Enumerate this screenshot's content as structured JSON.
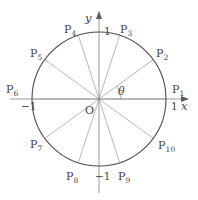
{
  "figure": {
    "background": "#ffffff",
    "stroke_circle": "#4d4d4d",
    "stroke_axis": "#8c8c8c",
    "stroke_chord": "#999999",
    "text_color": "#444444"
  },
  "geometry": {
    "center_x": 99,
    "center_y": 99,
    "radius": 67,
    "point_count": 10,
    "start_angle_deg": 0,
    "step_deg": 36
  },
  "axes": {
    "x_label": "x",
    "y_label": "y",
    "x_ticks": [
      {
        "value": "1",
        "at_deg": 0
      },
      {
        "value": "−1",
        "at_deg": 180
      }
    ],
    "y_ticks": [
      {
        "value": "1",
        "at_deg": 90
      },
      {
        "value": "−1",
        "at_deg": 270
      }
    ]
  },
  "annotations": {
    "origin_label": "O",
    "angle_label": "θ"
  },
  "points": [
    {
      "name": "P",
      "index": "1",
      "angle_deg": 0
    },
    {
      "name": "P",
      "index": "2",
      "angle_deg": 36
    },
    {
      "name": "P",
      "index": "3",
      "angle_deg": 72
    },
    {
      "name": "P",
      "index": "4",
      "angle_deg": 108
    },
    {
      "name": "P",
      "index": "5",
      "angle_deg": 144
    },
    {
      "name": "P",
      "index": "6",
      "angle_deg": 180
    },
    {
      "name": "P",
      "index": "7",
      "angle_deg": 216
    },
    {
      "name": "P",
      "index": "8",
      "angle_deg": 252
    },
    {
      "name": "P",
      "index": "9",
      "angle_deg": 288
    },
    {
      "name": "P",
      "index": "10",
      "angle_deg": 324
    }
  ],
  "labels": {
    "p1": {
      "text": "P",
      "sub": "1"
    },
    "p2": {
      "text": "P",
      "sub": "2"
    },
    "p3": {
      "text": "P",
      "sub": "3"
    },
    "p4": {
      "text": "P",
      "sub": "4"
    },
    "p5": {
      "text": "P",
      "sub": "5"
    },
    "p6": {
      "text": "P",
      "sub": "6"
    },
    "p7": {
      "text": "P",
      "sub": "7"
    },
    "p8": {
      "text": "P",
      "sub": "8"
    },
    "p9": {
      "text": "P",
      "sub": "9"
    },
    "p10": {
      "text": "P",
      "sub": "10"
    },
    "tick_x_pos": "1",
    "tick_x_neg": "−1",
    "tick_y_pos": "1",
    "tick_y_neg": "−1",
    "axis_x": "x",
    "axis_y": "y",
    "origin": "O",
    "theta": "θ"
  }
}
